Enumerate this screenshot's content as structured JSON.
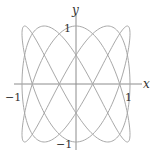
{
  "chart_data": {
    "type": "line",
    "title": "",
    "subtitle": "",
    "parametric": {
      "x": "cos(3t)",
      "y": "sin(5t)",
      "t_range": [
        0,
        6.283185307
      ]
    },
    "xlabel": "x",
    "ylabel": "y",
    "xlim": [
      -1,
      1
    ],
    "ylim": [
      -1,
      1
    ],
    "x_ticks": [
      {
        "value": -1,
        "label": "−1"
      },
      {
        "value": 1,
        "label": "1"
      }
    ],
    "y_ticks": [
      {
        "value": 1,
        "label": "1"
      },
      {
        "value": -1,
        "label": "−1"
      }
    ],
    "grid": false,
    "legend": null,
    "series": [
      {
        "name": "Lissajous curve",
        "color": "#a8a8a8",
        "samples": 600
      }
    ]
  },
  "style": {
    "axis_color": "#8c8c8c",
    "curve_color": "#a8a8a8",
    "text_color": "#333333"
  },
  "layout": {
    "origin_px": [
      76,
      84
    ],
    "scale_x_px": 54,
    "scale_y_px": 58
  }
}
